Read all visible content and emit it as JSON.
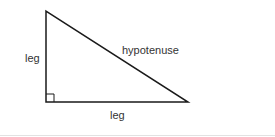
{
  "diagram": {
    "labels": {
      "left_leg": "leg",
      "hypotenuse": "hypotenuse",
      "bottom_leg": "leg"
    },
    "vertices": {
      "top": [
        46,
        11
      ],
      "right_angle": [
        46,
        102
      ],
      "bottom_right": [
        188,
        102
      ]
    },
    "stroke_color": "#1a1a1a",
    "text_color": "#333333"
  }
}
